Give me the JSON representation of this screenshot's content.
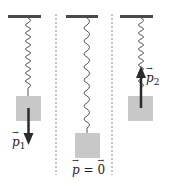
{
  "diagram": {
    "colors": {
      "ceiling": "#4a4a4a",
      "spring": "#555555",
      "block": "#c8c8c8",
      "arrow": "#2b2b2b",
      "divider": "#888888"
    },
    "panels": [
      {
        "id": "left",
        "label_var": "p",
        "label_sub": "1",
        "arrow": "down"
      },
      {
        "id": "middle",
        "label_var": "p",
        "label_eq": " = ",
        "label_rhs": "0",
        "arrow": "none"
      },
      {
        "id": "right",
        "label_var": "p",
        "label_sub": "2",
        "arrow": "up"
      }
    ]
  }
}
